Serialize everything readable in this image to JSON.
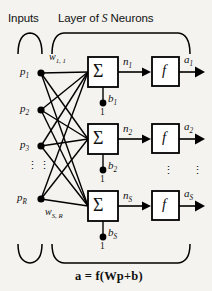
{
  "figure": {
    "name": "layer-of-s-neurons-abbreviated-diagram",
    "background_color": "#f4f3ef",
    "ink_color": "#000000"
  },
  "headers": {
    "inputs": "Inputs",
    "layer_prefix": "Layer of ",
    "layer_italic": "S",
    "layer_suffix": " Neurons"
  },
  "inputs": {
    "nodes": [
      {
        "id": "p1",
        "label": "p",
        "sub": "1"
      },
      {
        "id": "p2",
        "label": "p",
        "sub": "2"
      },
      {
        "id": "p3",
        "label": "p",
        "sub": "3"
      },
      {
        "id": "pR",
        "label": "p",
        "sub": "R"
      }
    ],
    "ellipsis": "⋮"
  },
  "weights": {
    "top": {
      "label": "w",
      "sub": "1, 1"
    },
    "bottom": {
      "label": "w",
      "sub": "S, R"
    }
  },
  "neurons": [
    {
      "id": "neuron-1",
      "sum_glyph": "Σ",
      "net_label": "n",
      "net_sub": "1",
      "transfer_glyph": "f",
      "output_label": "a",
      "output_sub": "1",
      "bias_label": "b",
      "bias_sub": "1",
      "bias_input": "1"
    },
    {
      "id": "neuron-2",
      "sum_glyph": "Σ",
      "net_label": "n",
      "net_sub": "2",
      "transfer_glyph": "f",
      "output_label": "a",
      "output_sub": "2",
      "bias_label": "b",
      "bias_sub": "2",
      "bias_input": "1"
    },
    {
      "id": "neuron-s",
      "sum_glyph": "Σ",
      "net_label": "n",
      "net_sub": "S",
      "transfer_glyph": "f",
      "output_label": "a",
      "output_sub": "S",
      "bias_label": "b",
      "bias_sub": "S",
      "bias_input": "1"
    }
  ],
  "column_ellipses": {
    "transfer": "⋮",
    "output": "⋮"
  },
  "equation": {
    "text": "a = f(Wp+b)"
  }
}
